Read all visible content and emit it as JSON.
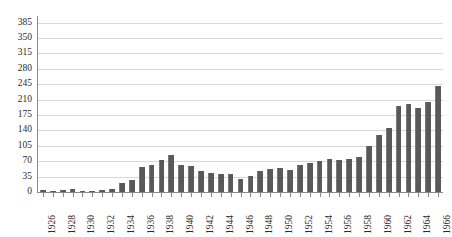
{
  "chart_data": {
    "type": "bar",
    "title": "",
    "subtitle": "",
    "xlabel": "",
    "ylabel": "",
    "grid": true,
    "legend": "none",
    "ylim": [
      0,
      400
    ],
    "yticks": [
      0,
      35,
      70,
      105,
      140,
      175,
      210,
      245,
      280,
      315,
      350,
      385
    ],
    "ytick_labels": [
      "0",
      "35",
      "70",
      "105",
      "140",
      "175",
      "210",
      "245",
      "280",
      "315",
      "350",
      "385"
    ],
    "categories": [
      "1926",
      "1927",
      "1928",
      "1929",
      "1930",
      "1931",
      "1932",
      "1933",
      "1934",
      "1935",
      "1936",
      "1937",
      "1938",
      "1939",
      "1940",
      "1941",
      "1942",
      "1943",
      "1944",
      "1945",
      "1946",
      "1947",
      "1948",
      "1949",
      "1950",
      "1951",
      "1952",
      "1953",
      "1954",
      "1955",
      "1956",
      "1957",
      "1958",
      "1959",
      "1960",
      "1961",
      "1962",
      "1963",
      "1964",
      "1965",
      "1966"
    ],
    "xtick_labels_shown": [
      "1926",
      "1928",
      "1930",
      "1932",
      "1934",
      "1936",
      "1938",
      "1940",
      "1942",
      "1944",
      "1946",
      "1948",
      "1950",
      "1952",
      "1954",
      "1956",
      "1958",
      "1960",
      "1962",
      "1964",
      "1966"
    ],
    "values": [
      4,
      3,
      4,
      6,
      3,
      2,
      4,
      6,
      20,
      28,
      56,
      62,
      72,
      85,
      62,
      60,
      48,
      44,
      42,
      40,
      30,
      36,
      48,
      52,
      54,
      50,
      62,
      66,
      70,
      75,
      72,
      76,
      80,
      105,
      130,
      146,
      195,
      200,
      190,
      205,
      240
    ],
    "bar_color": "#595959",
    "gridline_color": "#d8d8d8",
    "axis_color": "#8a8a8a",
    "background_color": "#ffffff"
  }
}
